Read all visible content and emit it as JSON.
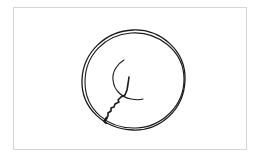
{
  "sketch": {
    "description": "Hand-drawn sketch: double-stroked circle with an inner curved arc and a jagged crack-like line running from the center to the lower-left edge",
    "stroke_color": "#1a1a1a",
    "frame_color": "#d4d4d4",
    "background_color": "#ffffff",
    "elements": [
      {
        "name": "outer-circle-loop-1",
        "shape": "circle",
        "cx": 133,
        "cy": 81,
        "r": 52
      },
      {
        "name": "outer-circle-loop-2",
        "shape": "circle",
        "cx": 134,
        "cy": 80,
        "r": 50
      },
      {
        "name": "inner-arc",
        "shape": "arc"
      },
      {
        "name": "jagged-line",
        "shape": "polyline"
      }
    ]
  }
}
